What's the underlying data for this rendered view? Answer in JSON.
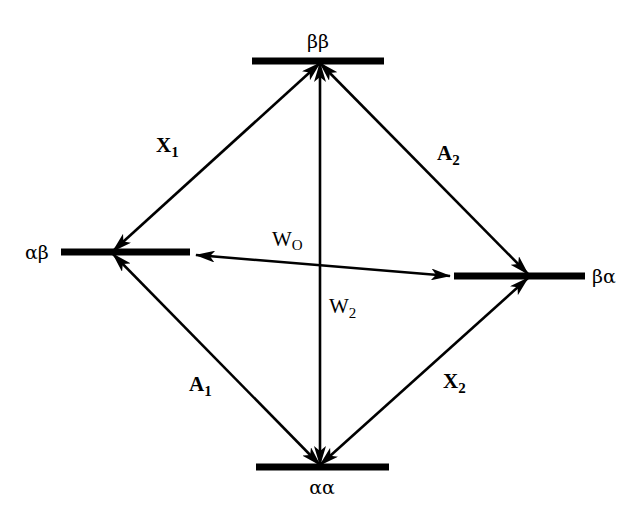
{
  "diagram": {
    "type": "energy-level transition diagram",
    "states": [
      {
        "id": "bb",
        "label": "ββ",
        "position": "top"
      },
      {
        "id": "ab",
        "label": "αβ",
        "position": "left"
      },
      {
        "id": "ba",
        "label": "βα",
        "position": "right"
      },
      {
        "id": "aa",
        "label": "αα",
        "position": "bottom"
      }
    ],
    "transitions": [
      {
        "id": "X1",
        "main": "X",
        "sub": "1",
        "from": "αβ",
        "to": "ββ",
        "bold": true
      },
      {
        "id": "A2",
        "main": "A",
        "sub": "2",
        "from": "ββ",
        "to": "βα",
        "bold": true
      },
      {
        "id": "A1",
        "main": "A",
        "sub": "1",
        "from": "αβ",
        "to": "αα",
        "bold": true
      },
      {
        "id": "X2",
        "main": "X",
        "sub": "2",
        "from": "βα",
        "to": "αα",
        "bold": true
      },
      {
        "id": "W0",
        "main": "W",
        "sub": "O",
        "from": "αβ",
        "to": "βα",
        "bold": false
      },
      {
        "id": "W2",
        "main": "W",
        "sub": "2",
        "from": "ββ",
        "to": "αα",
        "bold": false
      }
    ]
  }
}
